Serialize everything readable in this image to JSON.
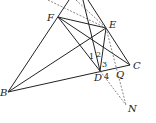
{
  "diagram": {
    "type": "geometry",
    "points": {
      "B": {
        "label": "B",
        "x": 8,
        "y": 92
      },
      "F": {
        "label": "F",
        "x": 58,
        "y": 17
      },
      "E": {
        "label": "E",
        "x": 106,
        "y": 28
      },
      "D": {
        "label": "D",
        "x": 100,
        "y": 71
      },
      "C": {
        "label": "C",
        "x": 130,
        "y": 65
      },
      "N": {
        "label": "N",
        "x": 126,
        "y": 105
      },
      "Q": {
        "label": "Q",
        "x": 119,
        "y": 68
      },
      "H": {
        "x": 92,
        "y": 38
      }
    },
    "angle_labels": [
      "1",
      "2",
      "3",
      "4"
    ]
  }
}
